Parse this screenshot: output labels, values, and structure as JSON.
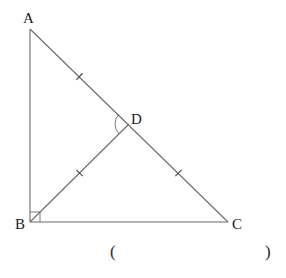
{
  "figure": {
    "width": 286,
    "height": 278,
    "line_color": "#6b6b6b",
    "text_color": "#1a1a1a",
    "points": {
      "A": {
        "label": "A",
        "x": 30,
        "y": 29,
        "label_x": 23,
        "label_y": 23
      },
      "B": {
        "label": "B",
        "x": 30,
        "y": 222,
        "label_x": 15,
        "label_y": 229
      },
      "C": {
        "label": "C",
        "x": 228,
        "y": 222,
        "label_x": 232,
        "label_y": 229
      },
      "D": {
        "label": "D",
        "x": 129,
        "y": 124,
        "label_x": 131,
        "label_y": 124
      }
    },
    "segments": [
      {
        "name": "segment-ab",
        "from": "A",
        "to": "B"
      },
      {
        "name": "segment-bc",
        "from": "B",
        "to": "C"
      },
      {
        "name": "segment-ac",
        "from": "A",
        "to": "C"
      },
      {
        "name": "segment-bd",
        "from": "B",
        "to": "D"
      }
    ],
    "equal_marks": [
      {
        "name": "tick-ad",
        "on": "AD"
      },
      {
        "name": "tick-dc",
        "on": "DC"
      },
      {
        "name": "tick-bd",
        "on": "BD"
      }
    ],
    "right_angle": {
      "at": "B",
      "size": 10
    },
    "angle_arc": {
      "at": "D",
      "between": [
        "A",
        "B"
      ],
      "radius": 14
    }
  },
  "answer_blank": {
    "open": "(",
    "close": ")",
    "open_x": 110,
    "close_x": 265,
    "y": 257
  }
}
